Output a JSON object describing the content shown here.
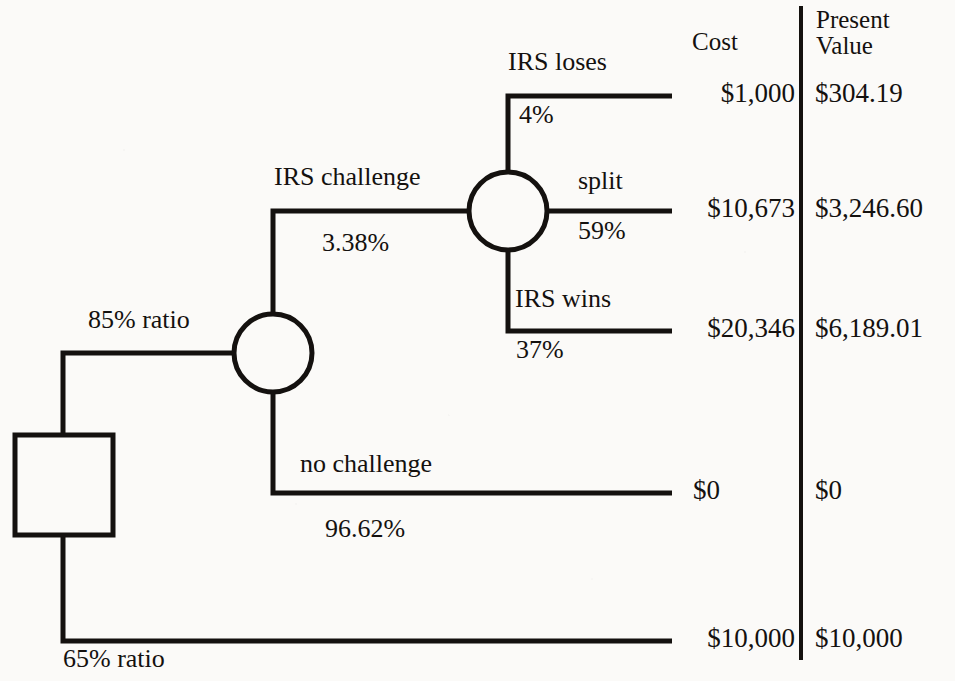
{
  "figure": {
    "type": "decision-tree",
    "background_color": "#fbfaf8",
    "line_color": "#14110f"
  },
  "columns": {
    "cost_header": "Cost",
    "present_value_header_line1": "Present",
    "present_value_header_line2": "Value"
  },
  "root": {
    "node_type": "decision-square",
    "branches": [
      {
        "label": "85% ratio"
      },
      {
        "label": "65% ratio"
      }
    ]
  },
  "chance_node_1": {
    "node_type": "chance-circle",
    "branches": [
      {
        "label": "IRS challenge",
        "probability": "3.38%"
      },
      {
        "label": "no challenge",
        "probability": "96.62%"
      }
    ]
  },
  "chance_node_2": {
    "node_type": "chance-circle",
    "branches": [
      {
        "label": "IRS loses",
        "probability": "4%"
      },
      {
        "label": "split",
        "probability": "59%"
      },
      {
        "label": "IRS wins",
        "probability": "37%"
      }
    ]
  },
  "outcomes": [
    {
      "name": "irs-loses",
      "cost": "$1,000",
      "present_value": "$304.19"
    },
    {
      "name": "split",
      "cost": "$10,673",
      "present_value": "$3,246.60"
    },
    {
      "name": "irs-wins",
      "cost": "$20,346",
      "present_value": "$6,189.01"
    },
    {
      "name": "no-challenge",
      "cost": "$0",
      "present_value": "$0"
    },
    {
      "name": "ratio-65",
      "cost": "$10,000",
      "present_value": "$10,000"
    }
  ]
}
